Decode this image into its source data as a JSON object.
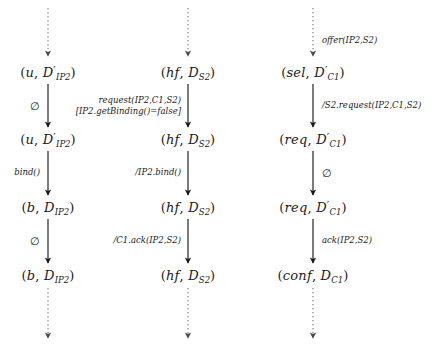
{
  "diagram": {
    "type": "uml-state-lifelines",
    "title": "",
    "background": "#ffffff",
    "stroke_color": "#1a1a1a",
    "columns": [
      {
        "name": "ip2-lifeline",
        "x": 48,
        "entry_arrow": {
          "label": "",
          "from_y": 8,
          "to_y": 56
        },
        "states": [
          {
            "name": "state-u-d-ip2-1",
            "y": 72,
            "text": "(u, D'_{IP2})",
            "base": "u",
            "second": "D",
            "prime": true,
            "sub": "IP2"
          },
          {
            "name": "state-u-d-ip2-2",
            "y": 139,
            "text": "(u, D'_{IP2})",
            "base": "u",
            "second": "D",
            "prime": true,
            "sub": "IP2"
          },
          {
            "name": "state-b-d-ip2-1",
            "y": 207,
            "text": "(b, D_{IP2})",
            "base": "b",
            "second": "D",
            "prime": false,
            "sub": "IP2"
          },
          {
            "name": "state-b-d-ip2-2",
            "y": 275,
            "text": "(b, D_{IP2})",
            "base": "b",
            "second": "D",
            "prime": false,
            "sub": "IP2"
          }
        ],
        "transitions": [
          {
            "name": "transition-empty-1",
            "from_y": 84,
            "to_y": 127,
            "label_lines": [
              "∅"
            ],
            "side": "left",
            "label_x": 40,
            "emphasis": true
          },
          {
            "name": "transition-bind",
            "from_y": 151,
            "to_y": 195,
            "label_lines": [
              "bind()"
            ],
            "side": "left",
            "label_x": 40,
            "emphasis": false
          },
          {
            "name": "transition-empty-2",
            "from_y": 219,
            "to_y": 263,
            "label_lines": [
              "∅"
            ],
            "side": "left",
            "label_x": 40,
            "emphasis": true
          }
        ],
        "exit_arrow": {
          "from_y": 288,
          "to_y": 338
        }
      },
      {
        "name": "s2-lifeline",
        "x": 188,
        "entry_arrow": {
          "label": "",
          "from_y": 8,
          "to_y": 56
        },
        "states": [
          {
            "name": "state-hf-d-s2-1",
            "y": 72,
            "text": "(hf, D_{S2})",
            "base": "hf",
            "second": "D",
            "prime": false,
            "sub": "S2"
          },
          {
            "name": "state-hf-d-s2-2",
            "y": 139,
            "text": "(hf, D_{S2})",
            "base": "hf",
            "second": "D",
            "prime": false,
            "sub": "S2"
          },
          {
            "name": "state-hf-d-s2-3",
            "y": 207,
            "text": "(hf, D_{S2})",
            "base": "hf",
            "second": "D",
            "prime": false,
            "sub": "S2"
          },
          {
            "name": "state-hf-d-s2-4",
            "y": 275,
            "text": "(hf, D_{S2})",
            "base": "hf",
            "second": "D",
            "prime": false,
            "sub": "S2"
          }
        ],
        "transitions": [
          {
            "name": "transition-request-guard",
            "from_y": 84,
            "to_y": 127,
            "label_lines": [
              "request(IP2,C1,S2)",
              "[IP2.getBinding()=false]"
            ],
            "side": "left",
            "label_x": 181,
            "emphasis": false
          },
          {
            "name": "transition-ip2-bind",
            "from_y": 151,
            "to_y": 195,
            "label_lines": [
              "/IP2.bind()"
            ],
            "side": "left",
            "label_x": 181,
            "emphasis": false
          },
          {
            "name": "transition-c1-ack",
            "from_y": 219,
            "to_y": 263,
            "label_lines": [
              "/C1.ack(IP2,S2)"
            ],
            "side": "left",
            "label_x": 181,
            "emphasis": false
          }
        ],
        "exit_arrow": {
          "from_y": 288,
          "to_y": 338
        }
      },
      {
        "name": "c1-lifeline",
        "x": 313,
        "entry_arrow": {
          "label": "offer(IP2,S2)",
          "from_y": 8,
          "to_y": 56
        },
        "entry_label_x": 322,
        "entry_label_y": 41,
        "states": [
          {
            "name": "state-sel-d-c1",
            "y": 72,
            "text": "(sel, D'_{C1})",
            "base": "sel",
            "second": "D",
            "prime": true,
            "sub": "C1"
          },
          {
            "name": "state-req-d-c1-1",
            "y": 139,
            "text": "(req, D'_{C1})",
            "base": "req",
            "second": "D",
            "prime": true,
            "sub": "C1"
          },
          {
            "name": "state-req-d-c1-2",
            "y": 207,
            "text": "(req, D'_{C1})",
            "base": "req",
            "second": "D",
            "prime": true,
            "sub": "C1"
          },
          {
            "name": "state-conf-d-c1",
            "y": 275,
            "text": "(conf, D_{C1})",
            "base": "conf",
            "second": "D",
            "prime": false,
            "sub": "C1"
          }
        ],
        "transitions": [
          {
            "name": "transition-s2-request",
            "from_y": 84,
            "to_y": 127,
            "label_lines": [
              "/S2.request(IP2,C1,S2)"
            ],
            "side": "right",
            "label_x": 322,
            "emphasis": false
          },
          {
            "name": "transition-empty-3",
            "from_y": 151,
            "to_y": 195,
            "label_lines": [
              "∅"
            ],
            "side": "right",
            "label_x": 322,
            "emphasis": true
          },
          {
            "name": "transition-ack",
            "from_y": 219,
            "to_y": 263,
            "label_lines": [
              "ack(IP2,S2)"
            ],
            "side": "right",
            "label_x": 322,
            "emphasis": false
          }
        ],
        "exit_arrow": {
          "from_y": 288,
          "to_y": 338
        }
      }
    ]
  }
}
